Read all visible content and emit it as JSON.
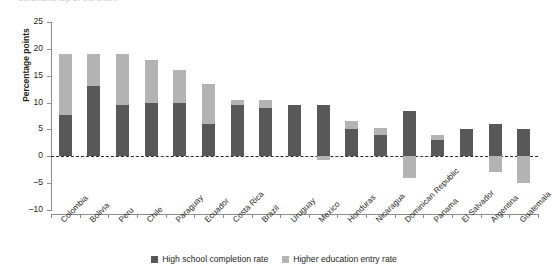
{
  "chart_data": {
    "type": "bar",
    "title": "Colombia, top of the chart",
    "subtitle": "",
    "stacked": true,
    "xlabel": "",
    "ylabel": "Percentage points",
    "ylim": [
      -10,
      25
    ],
    "yticks": [
      25,
      20,
      15,
      10,
      5,
      0,
      -5,
      -10
    ],
    "ytick_labels": [
      "25",
      "20",
      "15",
      "10",
      "5",
      "0",
      "-5",
      "-10"
    ],
    "grid": false,
    "zero_line": true,
    "legend_position": "bottom",
    "categories": [
      "Colombia",
      "Bolivia",
      "Peru",
      "Chile",
      "Paraguay",
      "Ecuador",
      "Costa Rica",
      "Brazil",
      "Uruguay",
      "Mexico",
      "Honduras",
      "Nicaragua",
      "Dominican Republic",
      "Panama",
      "El Salvador",
      "Argentina",
      "Guatemala"
    ],
    "series": [
      {
        "name": "High school completion rate",
        "color": "#58585a",
        "values": [
          7.7,
          13.0,
          9.5,
          10.0,
          10.0,
          6.0,
          9.5,
          9.0,
          9.5,
          9.5,
          5.0,
          4.0,
          8.5,
          3.0,
          5.0,
          6.0,
          5.0
        ]
      },
      {
        "name": "Higher education entry rate",
        "color": "#b3b3b3",
        "values": [
          11.3,
          6.0,
          9.5,
          8.0,
          6.0,
          7.5,
          1.0,
          1.5,
          0.0,
          -0.7,
          1.5,
          1.2,
          -4.0,
          1.0,
          0.0,
          -3.0,
          -5.0
        ]
      }
    ],
    "totals_positive": [
      19.0,
      19.0,
      19.0,
      18.0,
      16.0,
      13.5,
      10.5,
      10.5,
      9.5,
      9.5,
      6.5,
      5.2,
      8.5,
      4.0,
      5.0,
      6.0,
      5.0
    ]
  },
  "legend": {
    "items": [
      {
        "label": "High school completion rate",
        "color": "#58585a"
      },
      {
        "label": "Higher education entry rate",
        "color": "#b3b3b3"
      }
    ]
  }
}
